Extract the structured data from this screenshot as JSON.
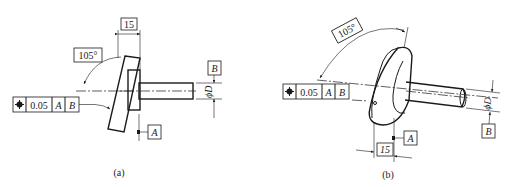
{
  "figure": {
    "panels": [
      {
        "caption": "(a)",
        "angle_dimension": "105°",
        "width_dimension": "15",
        "diameter_label": "ϕD",
        "datum_a": "A",
        "datum_b": "B",
        "feature_control_frame": {
          "symbol": "position",
          "tolerance": "0.05",
          "datum_primary": "A",
          "datum_secondary": "B"
        }
      },
      {
        "caption": "(b)",
        "angle_dimension": "105°",
        "width_dimension": "15",
        "diameter_label": "ϕD",
        "datum_a": "A",
        "datum_b": "B",
        "feature_control_frame": {
          "symbol": "position",
          "tolerance": "0.05",
          "datum_primary": "A",
          "datum_secondary": "B"
        }
      }
    ]
  }
}
